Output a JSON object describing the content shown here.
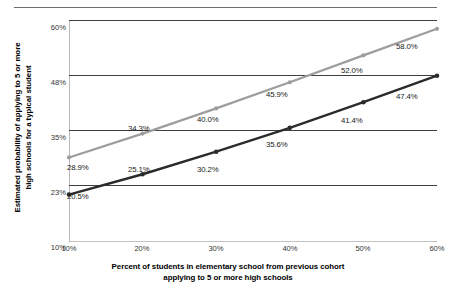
{
  "chart_data": {
    "type": "line",
    "title": "",
    "xlabel": "Percent of students in elementary school from previous cohort applying to 5 or more high schools",
    "ylabel": "Estimated probability of applying to 5 or more high schools for a typical student",
    "x": [
      10,
      20,
      30,
      40,
      50,
      60
    ],
    "xtick_labels": [
      "10%",
      "20%",
      "30%",
      "40%",
      "50%",
      "60%"
    ],
    "ytick_values": [
      10,
      23,
      35,
      48,
      60
    ],
    "ytick_labels": [
      "10%",
      "23%",
      "35%",
      "48%",
      "60%"
    ],
    "ylim": [
      10,
      60
    ],
    "xlim": [
      10,
      60
    ],
    "grid": true,
    "legend": "none",
    "series": [
      {
        "name": "upper",
        "color": "#9d9d9d",
        "values": [
          28.9,
          34.3,
          40.0,
          45.9,
          52.0,
          58.0
        ],
        "labels": [
          "28.9%",
          "34.3%",
          "40.0%",
          "45.9%",
          "52.0%",
          "58.0%"
        ]
      },
      {
        "name": "lower",
        "color": "#2b2b2b",
        "values": [
          20.5,
          25.1,
          30.2,
          35.6,
          41.4,
          47.4
        ],
        "labels": [
          "20.5%",
          "25.1%",
          "30.2%",
          "35.6%",
          "41.4%",
          "47.4%"
        ]
      }
    ]
  },
  "axes": {
    "x_title_line1": "Percent of students in elementary school from previous cohort",
    "x_title_line2": "applying to 5 or more high schools",
    "y_title_line1": "Estimated probability of applying to 5 or more",
    "y_title_line2": "high schools for a typical student"
  },
  "yticks": {
    "t0": "60%",
    "t1": "48%",
    "t2": "35%",
    "t3": "23%",
    "t4": "10%"
  },
  "xticks": {
    "t0": "10%",
    "t1": "20%",
    "t2": "30%",
    "t3": "40%",
    "t4": "50%",
    "t5": "60%"
  },
  "labels_upper": {
    "l0": "28.9%",
    "l1": "34.3%",
    "l2": "40.0%",
    "l3": "45.9%",
    "l4": "52.0%",
    "l5": "58.0%"
  },
  "labels_lower": {
    "l0": "20.5%",
    "l1": "25.1%",
    "l2": "30.2%",
    "l3": "35.6%",
    "l4": "41.4%",
    "l5": "47.4%"
  },
  "colors": {
    "upper_series": "#9d9d9d",
    "lower_series": "#2b2b2b",
    "gridline": "#3f3f3f",
    "axis": "#c2c2c2",
    "top_rule": "#6f6f6f"
  }
}
